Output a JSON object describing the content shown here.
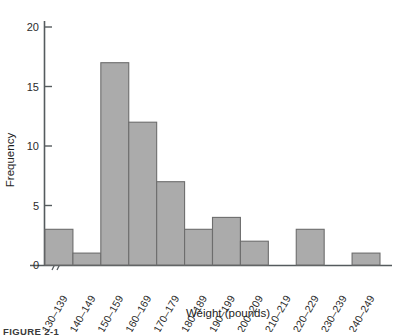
{
  "chart_data": {
    "type": "bar",
    "title": "",
    "xlabel": "Weight (pounds)",
    "ylabel": "Frequency",
    "categories": [
      "130–139",
      "140–149",
      "150–159",
      "160–169",
      "170–179",
      "180–189",
      "190–199",
      "200–209",
      "210–219",
      "220–229",
      "230–239",
      "240–249"
    ],
    "values": [
      3,
      1,
      17,
      12,
      7,
      3,
      4,
      2,
      0,
      3,
      0,
      1
    ],
    "ylim": [
      0,
      20
    ],
    "yticks": [
      0,
      5,
      10,
      15,
      20
    ],
    "ytick_labels": [
      "0",
      "5",
      "10",
      "15",
      "20"
    ],
    "grid": false,
    "legend": null,
    "axis_break": "//",
    "bar_color": "#ababab",
    "bar_edge_color": "#6d6d6d",
    "axis_color": "#555b5e"
  },
  "caption": {
    "text": "FIGURE 2-1"
  }
}
